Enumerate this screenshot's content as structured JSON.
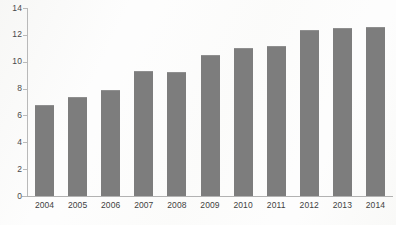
{
  "chart_data": {
    "type": "bar",
    "title": "",
    "subtitle": "",
    "xlabel": "",
    "ylabel": "",
    "categories": [
      "2004",
      "2005",
      "2006",
      "2007",
      "2008",
      "2009",
      "2010",
      "2011",
      "2012",
      "2013",
      "2014"
    ],
    "values": [
      6.8,
      7.4,
      7.9,
      9.3,
      9.2,
      10.5,
      11.0,
      11.2,
      12.4,
      12.5,
      12.6
    ],
    "ylim": [
      0,
      14
    ],
    "ytick_labels": [
      "0",
      "2",
      "4",
      "6",
      "8",
      "10",
      "12",
      "14"
    ],
    "ytick_values": [
      0,
      2,
      4,
      6,
      8,
      10,
      12,
      14
    ],
    "grid": false,
    "legend": null,
    "legend_position": "none",
    "annotations": [],
    "series_color": "#7d7d7d",
    "axis_color": "#b9b9b9",
    "tick_label_color": "#40404 0"
  },
  "colors": {
    "bar_fill": "#7d7d7d",
    "bar_top_edge": "#8f8f8f",
    "axis_line": "#b9b9b9",
    "background": "#fdfdfd",
    "text": "#404040"
  }
}
